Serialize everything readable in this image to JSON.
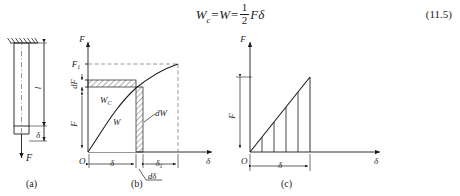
{
  "equation": {
    "lhs": "W",
    "lhs_sub": "c",
    "eq1": "=",
    "mid": "W",
    "eq2": "=",
    "frac_num": "1",
    "frac_den": "2",
    "rhs": "Fδ",
    "number": "(11.5)"
  },
  "figures": {
    "a": {
      "caption": "(a)",
      "labels": {
        "length": "l",
        "elongation": "δ",
        "force": "F"
      },
      "description": "fixed-end hanging bar under axial load"
    },
    "b": {
      "caption": "(b)",
      "axes": {
        "y": "F",
        "x": "δ",
        "origin": "O"
      },
      "labels": {
        "force_tick": "F",
        "force_tick_sub": "1",
        "dF": "dF",
        "complementary_work": "W",
        "complementary_work_sub": "C",
        "work": "W",
        "dW": "dW",
        "delta": "δ",
        "delta1": "δ",
        "delta1_sub": "1",
        "ddelta": "dδ"
      },
      "curve_type": "nonlinear"
    },
    "c": {
      "caption": "(c)",
      "axes": {
        "y": "F",
        "x": "δ",
        "origin": "O"
      },
      "labels": {
        "force": "F",
        "delta": "δ"
      },
      "curve_type": "linear",
      "strip_count": 5
    }
  },
  "colors": {
    "ink": "#1c1c1c",
    "hatch": "#4a4a4a",
    "dash": "#5a5a5a"
  }
}
